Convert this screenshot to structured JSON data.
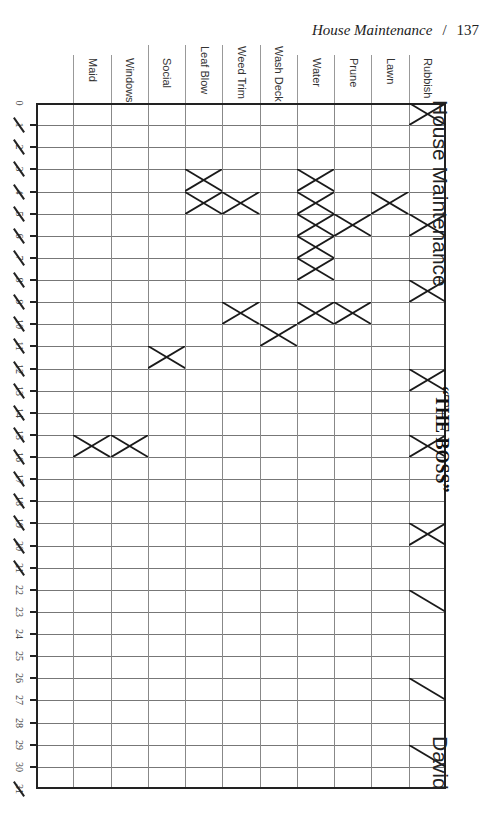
{
  "running_head": {
    "title": "House Maintenance",
    "separator": "/",
    "page": "137"
  },
  "side_titles": {
    "section": "House Maintenance",
    "role": "“THE BOSS”",
    "name": "David"
  },
  "columns": [
    "Maid",
    "Windows",
    "Social",
    "Leaf Blow",
    "Weed Trim",
    "Wash Deck",
    "Water",
    "Prune",
    "Lawn",
    "Rubbish"
  ],
  "row_labels": [
    {
      "n": "0",
      "struck": false
    },
    {
      "n": "1",
      "struck": true
    },
    {
      "n": "2",
      "struck": true
    },
    {
      "n": "3",
      "struck": true
    },
    {
      "n": "4",
      "struck": true
    },
    {
      "n": "5",
      "struck": true
    },
    {
      "n": "6",
      "struck": true
    },
    {
      "n": "7",
      "struck": true
    },
    {
      "n": "8",
      "struck": true
    },
    {
      "n": "9",
      "struck": true
    },
    {
      "n": "10",
      "struck": true
    },
    {
      "n": "11",
      "struck": true
    },
    {
      "n": "12",
      "struck": true
    },
    {
      "n": "13",
      "struck": true
    },
    {
      "n": "14",
      "struck": true
    },
    {
      "n": "15",
      "struck": true
    },
    {
      "n": "16",
      "struck": true
    },
    {
      "n": "17",
      "struck": true
    },
    {
      "n": "18",
      "struck": true
    },
    {
      "n": "19",
      "struck": true
    },
    {
      "n": "20",
      "struck": true
    },
    {
      "n": "21",
      "struck": true
    },
    {
      "n": "22",
      "struck": false
    },
    {
      "n": "23",
      "struck": false
    },
    {
      "n": "24",
      "struck": false
    },
    {
      "n": "25",
      "struck": false
    },
    {
      "n": "26",
      "struck": false
    },
    {
      "n": "27",
      "struck": false
    },
    {
      "n": "28",
      "struck": false
    },
    {
      "n": "29",
      "struck": false
    },
    {
      "n": "30",
      "struck": false
    },
    {
      "n": "31",
      "struck": true
    }
  ],
  "marks": {
    "Rubbish": {
      "x": [
        1,
        6,
        9,
        13,
        16,
        20
      ],
      "slash": [
        23,
        27,
        30
      ]
    },
    "Lawn": {
      "x": [
        5
      ],
      "slash": []
    },
    "Prune": {
      "x": [
        6,
        10
      ],
      "slash": []
    },
    "Water": {
      "x": [
        4,
        5,
        6,
        7,
        8,
        10
      ],
      "slash": []
    },
    "Wash Deck": {
      "x": [
        11
      ],
      "slash": []
    },
    "Weed Trim": {
      "x": [
        5,
        10
      ],
      "slash": []
    },
    "Leaf Blow": {
      "x": [
        4,
        5
      ],
      "slash": []
    },
    "Social": {
      "x": [
        12
      ],
      "slash": []
    },
    "Windows": {
      "x": [
        16
      ],
      "slash": []
    },
    "Maid": {
      "x": [
        16
      ],
      "slash": []
    }
  }
}
